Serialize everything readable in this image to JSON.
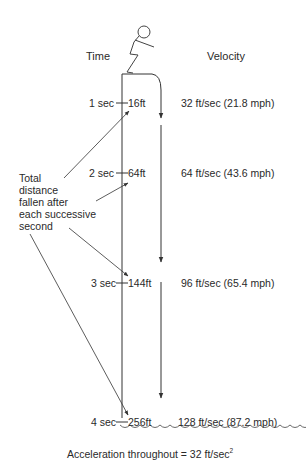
{
  "headers": {
    "time": "Time",
    "velocity": "Velocity"
  },
  "rows": [
    {
      "time": "1 sec",
      "distance": "16ft",
      "velocity": "32 ft/sec (21.8 mph)"
    },
    {
      "time": "2 sec",
      "distance": "64ft",
      "velocity": "64 ft/sec (43.6 mph)"
    },
    {
      "time": "3 sec",
      "distance": "144ft",
      "velocity": "96 ft/sec (65.4 mph)"
    },
    {
      "time": "4 sec",
      "distance": "256ft",
      "velocity": "128 ft/sec (87.2 mph)"
    }
  ],
  "annotation": {
    "lines": [
      "Total",
      "distance",
      "fallen after",
      "each successive",
      "second"
    ]
  },
  "footer": {
    "text": "Acceleration throughout = 32 ft/sec",
    "exponent": "2"
  },
  "icons": {
    "figure": "stick-figure-jumper",
    "water": "wavy-water-line"
  },
  "colors": {
    "line": "#333333",
    "text": "#2a2a2a"
  }
}
